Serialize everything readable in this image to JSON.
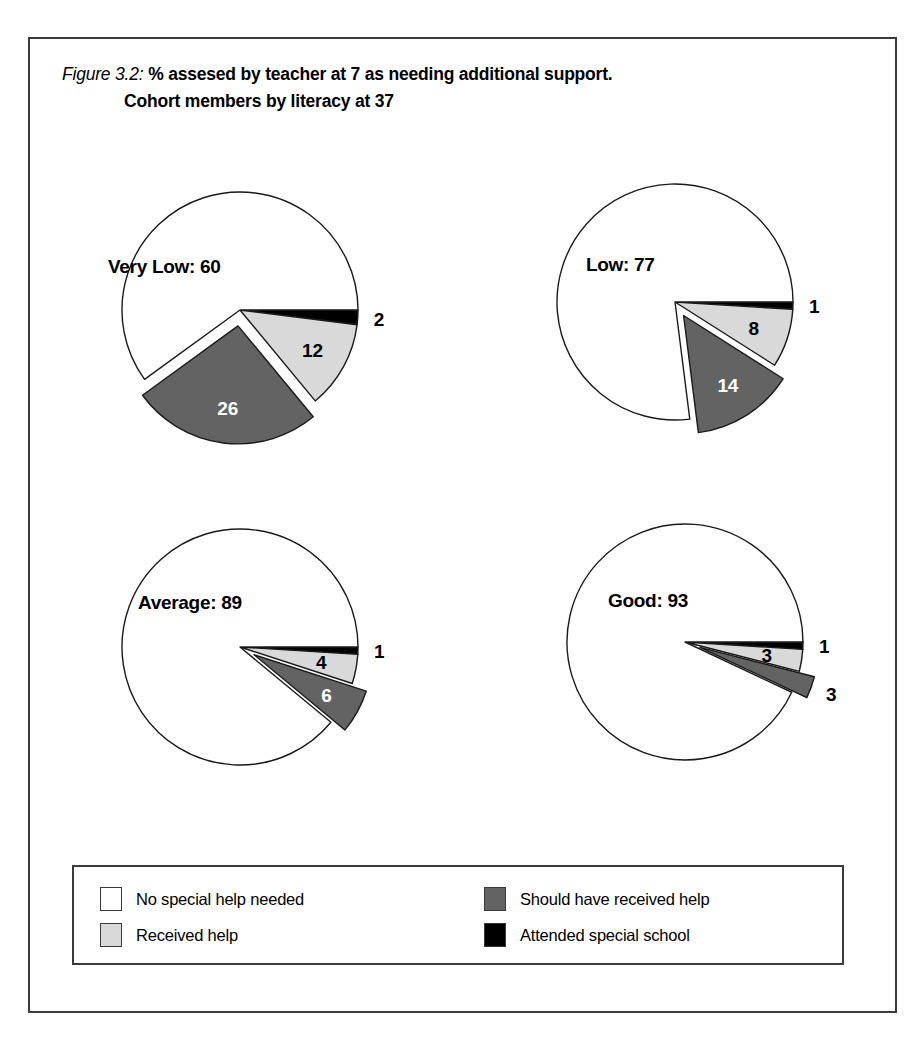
{
  "figure": {
    "label": "Figure 3.2:",
    "title_line1": "% assesed by teacher at 7 as needing additional support.",
    "title_line2": "Cohort members by literacy at 37"
  },
  "colors": {
    "no_help": "#ffffff",
    "received_help": "#d9d9d9",
    "should_have_received_help": "#636363",
    "special_school": "#000000",
    "outline": "#1a1a1a",
    "frame": "#3a3a3a"
  },
  "legend": {
    "items": [
      {
        "label": "No special help needed",
        "color": "#ffffff",
        "key": "no_help"
      },
      {
        "label": "Received help",
        "color": "#d9d9d9",
        "key": "received_help"
      },
      {
        "label": "Should have received help",
        "color": "#636363",
        "key": "should_have_received_help"
      },
      {
        "label": "Attended special school",
        "color": "#000000",
        "key": "special_school"
      }
    ]
  },
  "chart_data": {
    "type": "pie",
    "title": "Figure 3.2: % assesed by teacher at 7 as needing additional support. Cohort members by literacy at 37",
    "subtitle": "Cohort members by literacy at 37",
    "units": "percent",
    "legend_position": "bottom",
    "series_names": [
      "No special help needed",
      "Received help",
      "Should have received help",
      "Attended special school"
    ],
    "panels": [
      {
        "name": "Very Low",
        "center_label": "Very Low: 60",
        "slices": [
          {
            "category": "Attended special school",
            "value": 2,
            "label": "2",
            "color": "#000000",
            "exploded": false,
            "label_placement": "outside"
          },
          {
            "category": "Received help",
            "value": 12,
            "label": "12",
            "color": "#d9d9d9",
            "exploded": false,
            "label_placement": "inside"
          },
          {
            "category": "Should have received help",
            "value": 26,
            "label": "26",
            "color": "#636363",
            "exploded": true,
            "label_placement": "inside"
          },
          {
            "category": "No special help needed",
            "value": 60,
            "label": "60",
            "color": "#ffffff",
            "exploded": false,
            "label_placement": "center"
          }
        ]
      },
      {
        "name": "Low",
        "center_label": "Low: 77",
        "slices": [
          {
            "category": "Attended special school",
            "value": 1,
            "label": "1",
            "color": "#000000",
            "exploded": false,
            "label_placement": "outside"
          },
          {
            "category": "Received help",
            "value": 8,
            "label": "8",
            "color": "#d9d9d9",
            "exploded": false,
            "label_placement": "inside"
          },
          {
            "category": "Should have received help",
            "value": 14,
            "label": "14",
            "color": "#636363",
            "exploded": true,
            "label_placement": "inside"
          },
          {
            "category": "No special help needed",
            "value": 77,
            "label": "77",
            "color": "#ffffff",
            "exploded": false,
            "label_placement": "center"
          }
        ]
      },
      {
        "name": "Average",
        "center_label": "Average: 89",
        "slices": [
          {
            "category": "Attended special school",
            "value": 1,
            "label": "1",
            "color": "#000000",
            "exploded": false,
            "label_placement": "outside"
          },
          {
            "category": "Received help",
            "value": 4,
            "label": "4",
            "color": "#d9d9d9",
            "exploded": false,
            "label_placement": "inside"
          },
          {
            "category": "Should have received help",
            "value": 6,
            "label": "6",
            "color": "#636363",
            "exploded": true,
            "label_placement": "inside"
          },
          {
            "category": "No special help needed",
            "value": 89,
            "label": "89",
            "color": "#ffffff",
            "exploded": false,
            "label_placement": "center"
          }
        ]
      },
      {
        "name": "Good",
        "center_label": "Good: 93",
        "slices": [
          {
            "category": "Attended special school",
            "value": 1,
            "label": "1",
            "color": "#000000",
            "exploded": false,
            "label_placement": "outside"
          },
          {
            "category": "Received help",
            "value": 3,
            "label": "3",
            "color": "#d9d9d9",
            "exploded": false,
            "label_placement": "inside"
          },
          {
            "category": "Should have received help",
            "value": 3,
            "label": "3",
            "color": "#636363",
            "exploded": true,
            "label_placement": "outside"
          },
          {
            "category": "No special help needed",
            "value": 93,
            "label": "93",
            "color": "#ffffff",
            "exploded": false,
            "label_placement": "center"
          }
        ]
      }
    ]
  },
  "layout": {
    "panels": [
      {
        "cx": 210,
        "cy": 271,
        "r": 118,
        "label_x": 78,
        "label_y": 217
      },
      {
        "cx": 645,
        "cy": 263,
        "r": 118,
        "label_x": 556,
        "label_y": 215
      },
      {
        "cx": 210,
        "cy": 608,
        "r": 118,
        "label_x": 108,
        "label_y": 553
      },
      {
        "cx": 655,
        "cy": 603,
        "r": 118,
        "label_x": 578,
        "label_y": 551
      }
    ]
  }
}
